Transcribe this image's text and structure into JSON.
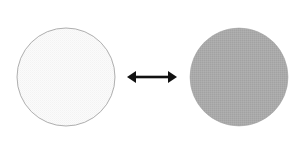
{
  "figure": {
    "title": "Two circles connected by a double-headed arrow",
    "background_color": "#ffffff",
    "width": 306,
    "height": 152,
    "left_circle": {
      "name": "light circle",
      "fill_color": "#fafafa",
      "stroke_color": "#9a9a9a",
      "stroke_width": 0.8,
      "center_x": 66,
      "center_y": 77,
      "radius": 49,
      "texture": "fine dithered halftone"
    },
    "right_circle": {
      "name": "gray circle",
      "fill_color": "#a9a9a9",
      "stroke_color": "#a0a0a0",
      "stroke_width": 0.5,
      "center_x": 239,
      "center_y": 77,
      "radius": 49,
      "texture": "fine dithered halftone"
    },
    "arrow": {
      "name": "double-headed arrow",
      "color": "#111111",
      "x_start": 127,
      "x_end": 177,
      "y": 77,
      "shaft_thickness": 2.6,
      "head_length": 9,
      "head_half_height": 6,
      "direction": "bidirectional"
    }
  }
}
